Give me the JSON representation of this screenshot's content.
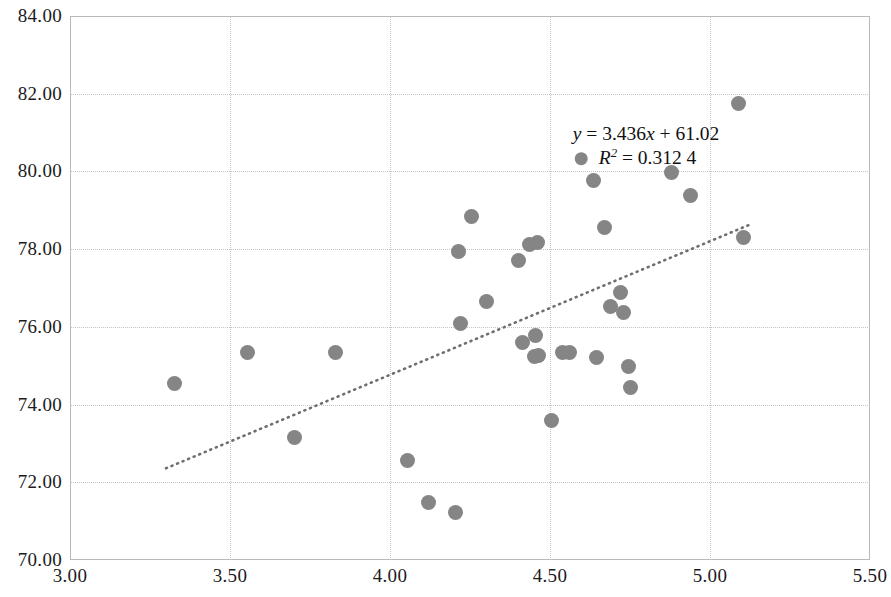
{
  "chart_data": {
    "type": "scatter",
    "title": "",
    "xlabel": "",
    "ylabel": "",
    "xlim": [
      3.0,
      5.5
    ],
    "ylim": [
      70.0,
      84.0
    ],
    "xticks": [
      "3.00",
      "3.50",
      "4.00",
      "4.50",
      "5.00",
      "5.50"
    ],
    "xtick_values": [
      3.0,
      3.5,
      4.0,
      4.5,
      5.0,
      5.5
    ],
    "yticks": [
      "70.00",
      "72.00",
      "74.00",
      "76.00",
      "78.00",
      "80.00",
      "82.00",
      "84.00"
    ],
    "ytick_values": [
      70.0,
      72.0,
      74.0,
      76.0,
      78.0,
      80.0,
      82.0,
      84.0
    ],
    "grid": true,
    "legend_position": "none",
    "marker_color": "#858585",
    "trendline_color": "#6e6e6e",
    "trendline_style": "dotted",
    "series": [
      {
        "name": "data",
        "x": [
          3.325,
          3.555,
          3.7,
          3.83,
          4.055,
          4.12,
          4.205,
          4.215,
          4.22,
          4.255,
          4.3,
          4.4,
          4.415,
          4.435,
          4.45,
          4.455,
          4.46,
          4.465,
          4.505,
          4.54,
          4.56,
          4.635,
          4.645,
          4.67,
          4.69,
          4.72,
          4.73,
          4.745,
          4.75,
          4.88,
          4.94,
          5.09,
          5.105
        ],
        "y": [
          74.55,
          75.33,
          73.15,
          75.33,
          72.55,
          71.47,
          71.22,
          77.93,
          76.09,
          78.85,
          76.66,
          77.72,
          75.61,
          78.12,
          75.25,
          75.78,
          78.18,
          75.27,
          73.58,
          75.33,
          75.33,
          79.77,
          75.22,
          78.55,
          76.53,
          76.88,
          76.38,
          74.98,
          74.43,
          79.96,
          79.38,
          81.74,
          78.31
        ]
      }
    ],
    "trendline": {
      "equation_line1": "y = 3.436x + 61.02",
      "equation_line2": "R",
      "equation_line2_sup": "2",
      "equation_line2_rest": " = 0.312 4",
      "slope": 3.436,
      "intercept": 61.02,
      "r_squared": 0.3124,
      "x_start": 3.3,
      "x_end": 5.13,
      "y_start": 72.36,
      "y_end": 78.65
    },
    "annotation_position": {
      "x": 4.8,
      "y": 80.65
    }
  }
}
